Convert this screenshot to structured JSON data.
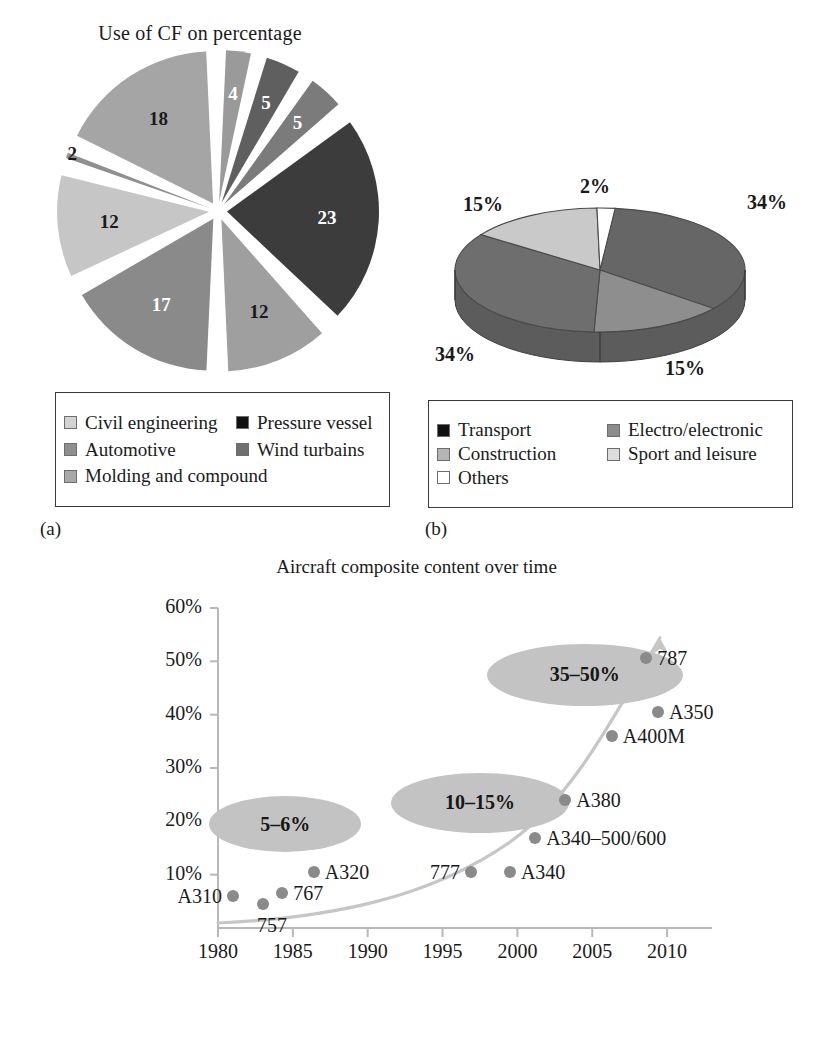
{
  "figure": {
    "panels": [
      {
        "key": "a",
        "caption": "(a)"
      },
      {
        "key": "b",
        "caption": "(b)"
      },
      {
        "key": "c",
        "caption": "(c)"
      }
    ]
  },
  "panel_a": {
    "caption": "(a)",
    "legend": [
      {
        "label": "Civil engineering",
        "color": "#d2d2d2"
      },
      {
        "label": "Pressure vessel",
        "color": "#111111"
      },
      {
        "label": "Automotive",
        "color": "#8f8f8f"
      },
      {
        "label": "Wind turbains",
        "color": "#6f6f6f"
      },
      {
        "label": "Molding and compound",
        "color": "#a8a8a8"
      }
    ],
    "chart_data": {
      "type": "pie",
      "title": "Use of CF on percentage",
      "exploded": true,
      "unit": "percent",
      "categories": [
        "4",
        "5",
        "5",
        "23",
        "12",
        "17",
        "12",
        "2",
        "18"
      ],
      "values": [
        4,
        5,
        5,
        23,
        12,
        17,
        12,
        2,
        18
      ],
      "labels": [
        "4",
        "5",
        "5",
        "23",
        "12",
        "17",
        "12",
        "2",
        "18"
      ],
      "colors": [
        "#9a9a9a",
        "#5f5f5f",
        "#7b7b7b",
        "#3c3c3c",
        "#9f9f9f",
        "#8a8a8a",
        "#c6c6c6",
        "#8f8f8f",
        "#a5a5a5"
      ],
      "label_colors": [
        "#ffffff",
        "#ffffff",
        "#ffffff",
        "#ffffff",
        "#1a1a1a",
        "#ffffff",
        "#1a1a1a",
        "#1a1a1a",
        "#1a1a1a"
      ],
      "legend": [
        "Civil engineering",
        "Pressure vessel",
        "Automotive",
        "Wind turbains",
        "Molding and compound"
      ]
    }
  },
  "panel_b": {
    "caption": "(b)",
    "legend": [
      {
        "label": "Transport",
        "color": "#111111"
      },
      {
        "label": "Electro/electronic",
        "color": "#8c8c8c"
      },
      {
        "label": "Construction",
        "color": "#b4b4b4"
      },
      {
        "label": "Sport and leisure",
        "color": "#dcdcdc"
      },
      {
        "label": "Others",
        "color": "#ffffff"
      }
    ],
    "chart_data": {
      "type": "pie",
      "title": "",
      "three_d": true,
      "unit": "percent",
      "categories": [
        "Transport",
        "Electro/electronic",
        "Construction",
        "Sport and leisure",
        "Others"
      ],
      "values": [
        34,
        15,
        34,
        15,
        2
      ],
      "labels": [
        "34%",
        "15%",
        "34%",
        "15%",
        "2%"
      ],
      "colors": [
        "#666666",
        "#8e8e8e",
        "#6e6e6e",
        "#c9c9c9",
        "#ffffff"
      ],
      "label_positions": [
        "right-top",
        "bottom-right",
        "bottom-left",
        "top-left",
        "top-center"
      ]
    },
    "labels": {
      "top": "2%",
      "upper_left": "15%",
      "right": "34%",
      "lower_left": "34%",
      "lower_right": "15%"
    }
  },
  "panel_c": {
    "caption": "(c)",
    "chart_data": {
      "type": "scatter",
      "title": "Aircraft composite content over time",
      "xlabel": "",
      "ylabel": "",
      "xlim": [
        1980,
        2013
      ],
      "ylim": [
        0,
        60
      ],
      "xticks": [
        1980,
        1985,
        1990,
        1995,
        2000,
        2005,
        2010
      ],
      "xtick_labels": [
        "1980",
        "1985",
        "1990",
        "1995",
        "2000",
        "2005",
        "2010"
      ],
      "yticks": [
        10,
        20,
        30,
        40,
        50,
        60
      ],
      "ytick_labels": [
        "10%",
        "20%",
        "30%",
        "40%",
        "50%",
        "60%"
      ],
      "grid": false,
      "legend": "none",
      "points": [
        {
          "name": "A310",
          "x": 1981,
          "y": 6,
          "label": "A310",
          "label_side": "left"
        },
        {
          "name": "757",
          "x": 1983,
          "y": 4.5,
          "label": "757",
          "label_side": "below"
        },
        {
          "name": "767",
          "x": 1984.3,
          "y": 6.5,
          "label": "767",
          "label_side": "right"
        },
        {
          "name": "A320",
          "x": 1986.4,
          "y": 10.5,
          "label": "A320",
          "label_side": "right"
        },
        {
          "name": "777",
          "x": 1996.9,
          "y": 10.5,
          "label": "777",
          "label_side": "left"
        },
        {
          "name": "A340",
          "x": 1999.5,
          "y": 10.5,
          "label": "A340",
          "label_side": "right"
        },
        {
          "name": "A340-500/600",
          "x": 2001.2,
          "y": 16.8,
          "label": "A340–500/600",
          "label_side": "right"
        },
        {
          "name": "A380",
          "x": 2003.2,
          "y": 24,
          "label": "A380",
          "label_side": "right"
        },
        {
          "name": "A400M",
          "x": 2006.3,
          "y": 36,
          "label": "A400M",
          "label_side": "right"
        },
        {
          "name": "A350",
          "x": 2009.4,
          "y": 40.5,
          "label": "A350",
          "label_side": "right"
        },
        {
          "name": "787",
          "x": 2008.6,
          "y": 50.7,
          "label": "787",
          "label_side": "right"
        }
      ],
      "annotations": [
        {
          "text": "5–6%",
          "x": 1984.5,
          "y": 19.5
        },
        {
          "text": "10–15%",
          "x": 1997.5,
          "y": 23.5
        },
        {
          "text": "35–50%",
          "x": 2004.5,
          "y": 47.5
        }
      ],
      "trend_curve": {
        "style": "exponential-arrow",
        "color": "#c0c0c0"
      }
    }
  }
}
